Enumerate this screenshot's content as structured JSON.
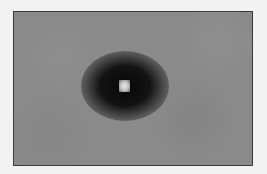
{
  "image": {
    "description": "Grayscale micrograph with a dark circular halo and a bright central spot on a uniform gray background",
    "colors": {
      "page_background": "#f2f2f2",
      "field_background": "#8a8a8a",
      "halo": "#0c0c0c",
      "core": "#e8e8e8",
      "border": "#3a3a3a"
    }
  }
}
